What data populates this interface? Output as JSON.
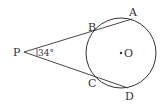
{
  "diagram": {
    "points": {
      "P": {
        "label": "P"
      },
      "A": {
        "label": "A"
      },
      "B": {
        "label": "B"
      },
      "C": {
        "label": "C"
      },
      "D": {
        "label": "D"
      },
      "O": {
        "label": "O"
      }
    },
    "angle": {
      "vertex": "P",
      "value": "34°"
    },
    "circle": {
      "center": "O"
    },
    "secants": [
      [
        "P",
        "B",
        "A"
      ],
      [
        "P",
        "C",
        "D"
      ]
    ],
    "colors": {
      "stroke": "#333333",
      "background": "#ffffff"
    }
  }
}
